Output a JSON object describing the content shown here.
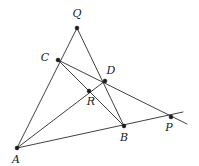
{
  "figure": {
    "kind": "geometry-diagram",
    "width": 199,
    "height": 166,
    "background_color": "#ffffff",
    "line_color": "#2b2b2b",
    "point_color": "#1a1a1a",
    "label_color": "#1a1a1a",
    "points": [
      {
        "id": "Q",
        "label": "Q",
        "x": 77,
        "y": 28,
        "label_x": 77,
        "label_y": 14
      },
      {
        "id": "C",
        "label": "C",
        "x": 58,
        "y": 60,
        "label_x": 45,
        "label_y": 58
      },
      {
        "id": "D",
        "label": "D",
        "x": 105,
        "y": 81,
        "label_x": 111,
        "label_y": 71
      },
      {
        "id": "R",
        "label": "R",
        "x": 89,
        "y": 91,
        "label_x": 91,
        "label_y": 102
      },
      {
        "id": "B",
        "label": "B",
        "x": 124,
        "y": 126,
        "label_x": 124,
        "label_y": 138
      },
      {
        "id": "P",
        "label": "P",
        "x": 171,
        "y": 117,
        "label_x": 169,
        "label_y": 128
      },
      {
        "id": "A",
        "label": "A",
        "x": 17,
        "y": 148,
        "label_x": 16,
        "label_y": 160
      }
    ],
    "segments": [
      {
        "id": "A-Q",
        "name": "line-a-q",
        "from": "A",
        "to": "Q",
        "x1": 17,
        "y1": 148,
        "x2": 77,
        "y2": 28
      },
      {
        "id": "Q-B",
        "name": "line-q-b",
        "from": "Q",
        "to": "B",
        "x1": 77,
        "y1": 28,
        "x2": 124,
        "y2": 126
      },
      {
        "id": "A-P",
        "name": "line-a-b-p",
        "from": "A",
        "to": "P",
        "x1": 17,
        "y1": 148,
        "x2": 183,
        "y2": 112
      },
      {
        "id": "C-P",
        "name": "line-c-d-p",
        "from": "C",
        "to": "P",
        "x1": 58,
        "y1": 60,
        "x2": 187,
        "y2": 124
      },
      {
        "id": "C-B",
        "name": "line-c-r-b",
        "from": "C",
        "to": "B",
        "x1": 58,
        "y1": 60,
        "x2": 124,
        "y2": 126
      },
      {
        "id": "A-D",
        "name": "line-a-r-d",
        "from": "A",
        "to": "D",
        "x1": 17,
        "y1": 148,
        "x2": 105,
        "y2": 81
      }
    ],
    "labels_note": "Italic serif single-letter vertex labels"
  }
}
